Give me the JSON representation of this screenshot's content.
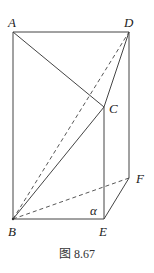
{
  "figure": {
    "caption": "图 8.67",
    "labels": {
      "A": "A",
      "B": "B",
      "C": "C",
      "D": "D",
      "E": "E",
      "F": "F",
      "alpha": "α"
    },
    "points": {
      "A": [
        13,
        32
      ],
      "D": [
        129,
        32
      ],
      "C": [
        104,
        107
      ],
      "B": [
        13,
        219
      ],
      "E": [
        104,
        219
      ],
      "F": [
        129,
        178
      ]
    },
    "segments_solid": [
      "AD",
      "AB",
      "DF",
      "AC",
      "CD",
      "CB",
      "CE",
      "BE",
      "EF"
    ],
    "segments_dashed": [
      "BD",
      "BF"
    ],
    "plane_label": "α"
  }
}
